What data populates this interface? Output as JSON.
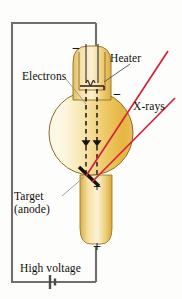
{
  "figure": {
    "labels": {
      "heater": "Heater",
      "electrons": "Electrons",
      "xrays": "X-rays",
      "target_line1": "Target",
      "target_line2": "(anode)",
      "high_voltage": "High voltage"
    },
    "polarity": {
      "cathode_top": "−",
      "cathode_side": "−",
      "anode_target": "+",
      "anode_bottom": "+"
    },
    "colors": {
      "glass_light": "#fdf6e0",
      "glass_amber": "#e8b53c",
      "glass_mid": "#f3d98b",
      "glass_outline": "#8a6a22",
      "xray_red": "#d6213a",
      "wire_gray": "#6f6f6f",
      "electron_black": "#1a1512",
      "target_black": "#171310",
      "leader_gray": "#8d8d8d",
      "background": "#fdfdfb"
    },
    "components": {
      "xray_beam_count": 2,
      "electron_beam_count": 2,
      "battery_symbol": "cell",
      "filament_shape": "coil"
    }
  }
}
